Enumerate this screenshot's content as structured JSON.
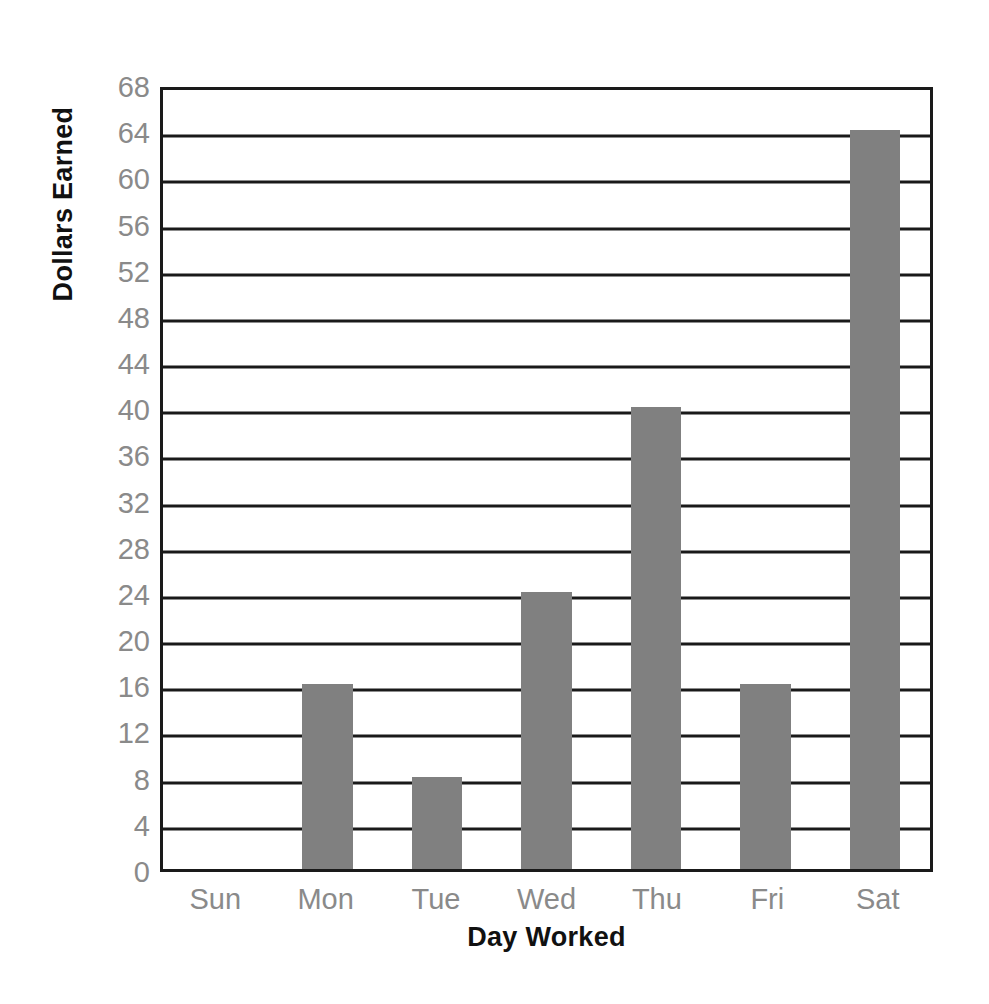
{
  "chart_data": {
    "type": "bar",
    "title": "",
    "categories": [
      "Sun",
      "Mon",
      "Tue",
      "Wed",
      "Thu",
      "Fri",
      "Sat"
    ],
    "values": [
      0,
      16,
      8,
      24,
      40,
      16,
      64
    ],
    "xlabel": "Day Worked",
    "ylabel": "Dollars Earned",
    "ylim": [
      0,
      68
    ],
    "ytick_step": 4,
    "yticks": [
      68,
      64,
      60,
      56,
      52,
      48,
      44,
      40,
      36,
      32,
      28,
      24,
      20,
      16,
      12,
      8,
      4,
      0
    ],
    "grid": "horizontal",
    "legend": "none",
    "colors": {
      "bar": "#808080",
      "gridline": "#1a1a1a",
      "axis_border": "#1a1a1a",
      "tick_label": "#8a8a8a",
      "axis_title": "#111111",
      "background": "#ffffff"
    }
  }
}
